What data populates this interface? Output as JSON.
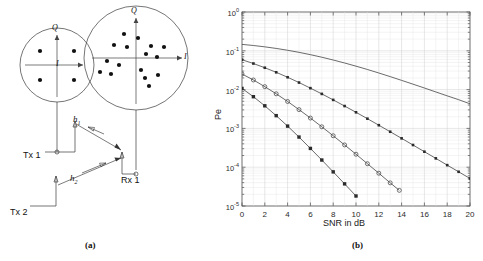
{
  "figure": {
    "panel_a_caption": "(a)",
    "panel_b_caption": "(b)"
  },
  "diagram": {
    "tx1_label": "Tx 1",
    "tx2_label": "Tx 2",
    "rx1_label": "Rx 1",
    "channel1_label": "h",
    "channel1_sub": "1",
    "channel2_label": "h",
    "channel2_sub": "2",
    "small_constellation": {
      "i_axis_label": "I",
      "q_axis_label": "Q",
      "points": [
        [
          -0.55,
          0.55
        ],
        [
          0.55,
          0.55
        ],
        [
          -0.55,
          -0.55
        ],
        [
          0.55,
          -0.55
        ]
      ]
    },
    "large_constellation": {
      "i_axis_label": "I",
      "q_axis_label": "Q",
      "points": [
        [
          -0.3,
          0.62
        ],
        [
          0.05,
          0.52
        ],
        [
          -0.55,
          0.34
        ],
        [
          -0.22,
          0.28
        ],
        [
          0.38,
          0.3
        ],
        [
          0.7,
          0.28
        ],
        [
          0.25,
          0.1
        ],
        [
          0.52,
          0.02
        ],
        [
          -0.72,
          -0.08
        ],
        [
          -0.42,
          -0.18
        ],
        [
          -0.86,
          -0.34
        ],
        [
          -0.58,
          -0.4
        ],
        [
          0.12,
          -0.3
        ],
        [
          0.22,
          -0.48
        ],
        [
          0.52,
          -0.42
        ],
        [
          0.3,
          -0.66
        ]
      ]
    }
  },
  "chart_data": {
    "type": "line",
    "title": "",
    "xlabel": "SNR in dB",
    "ylabel": "Pe",
    "xlim": [
      0,
      20
    ],
    "ylim": [
      1e-05,
      1
    ],
    "yscale": "log",
    "xticks": [
      0,
      2,
      4,
      6,
      8,
      10,
      12,
      14,
      16,
      18,
      20
    ],
    "yticks": [
      1,
      0.1,
      0.01,
      0.001,
      0.0001,
      1e-05
    ],
    "ytick_labels": [
      "10",
      "10",
      "10",
      "10",
      "10",
      "10"
    ],
    "ytick_exponents": [
      "0",
      "-1",
      "-2",
      "-3",
      "-4",
      "-5"
    ],
    "grid": true,
    "legend_position": "none",
    "series": [
      {
        "name": "no-diversity",
        "marker": "none",
        "x": [
          0,
          1,
          2,
          3,
          4,
          5,
          6,
          7,
          8,
          9,
          10,
          11,
          12,
          13,
          14,
          15,
          16,
          17,
          18,
          19,
          20
        ],
        "y": [
          0.1464,
          0.137,
          0.1265,
          0.1151,
          0.1033,
          0.0913,
          0.0795,
          0.0683,
          0.0579,
          0.0485,
          0.0402,
          0.033,
          0.0268,
          0.0216,
          0.0173,
          0.0138,
          0.011,
          0.0087,
          0.0069,
          0.0055,
          0.0043
        ]
      },
      {
        "name": "diversity-order-2",
        "marker": "plus",
        "x": [
          0,
          1,
          2,
          3,
          4,
          5,
          6,
          7,
          8,
          9,
          10,
          11,
          12,
          13,
          14,
          15,
          16,
          17,
          18,
          19,
          20
        ],
        "y": [
          0.0589,
          0.047,
          0.0366,
          0.0279,
          0.0208,
          0.0152,
          0.0109,
          0.00775,
          0.00543,
          0.00377,
          0.0026,
          0.00178,
          0.00121,
          0.00082,
          0.000554,
          0.000373,
          0.000251,
          0.000169,
          0.000113,
          7.62e-05,
          5.12e-05
        ]
      },
      {
        "name": "diversity-order-3",
        "marker": "circle",
        "x": [
          0,
          1,
          2,
          3,
          4,
          5,
          6,
          7,
          8,
          9,
          10,
          11,
          12,
          13,
          13.8
        ],
        "y": [
          0.0252,
          0.0177,
          0.0119,
          0.00779,
          0.00494,
          0.00305,
          0.00185,
          0.0011,
          0.000646,
          0.000375,
          0.000216,
          0.000123,
          7e-05,
          3.95e-05,
          2.53e-05
        ]
      },
      {
        "name": "diversity-order-4",
        "marker": "filled-square",
        "x": [
          0,
          1,
          2,
          3,
          4,
          5,
          6,
          7,
          8,
          9,
          10
        ],
        "y": [
          0.01072,
          0.00656,
          0.00382,
          0.00213,
          0.001146,
          0.000598,
          0.000305,
          0.000153,
          7.58e-05,
          3.72e-05,
          1.81e-05
        ]
      }
    ]
  },
  "colors": {
    "line": "#3a3a3a",
    "grid": "#d8d8d8",
    "axis": "#4a4a4a",
    "text": "#1a1a1a"
  }
}
